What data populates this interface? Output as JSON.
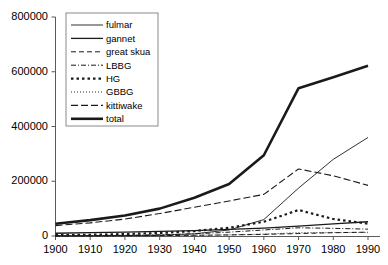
{
  "chart_data": {
    "type": "line",
    "title": "",
    "xlabel": "",
    "ylabel": "",
    "xlim": [
      1900,
      1990
    ],
    "ylim": [
      0,
      800000
    ],
    "grid": false,
    "legend_position": "top-left",
    "x": [
      1900,
      1910,
      1920,
      1930,
      1940,
      1950,
      1960,
      1970,
      1980,
      1990
    ],
    "xticks": [
      "1900",
      "1910",
      "1920",
      "1930",
      "1940",
      "1950",
      "1960",
      "1970",
      "1980",
      "1990"
    ],
    "yticks": [
      "0",
      "200000",
      "400000",
      "600000",
      "800000"
    ],
    "ytick_values": [
      0,
      200000,
      400000,
      600000,
      800000
    ],
    "series": [
      {
        "name": "fulmar",
        "style": "thin-solid",
        "values": [
          500,
          800,
          1500,
          3000,
          8000,
          22000,
          60000,
          175000,
          280000,
          360000
        ]
      },
      {
        "name": "gannet",
        "style": "solid",
        "values": [
          10000,
          12000,
          14000,
          17000,
          20000,
          24000,
          29000,
          36000,
          44000,
          52000
        ]
      },
      {
        "name": "great skua",
        "style": "dashed",
        "values": [
          300,
          500,
          900,
          1600,
          2600,
          4000,
          6000,
          9000,
          12000,
          14000
        ]
      },
      {
        "name": "LBBG",
        "style": "dash-dot",
        "values": [
          1000,
          1500,
          2500,
          4500,
          8000,
          14000,
          22000,
          30000,
          28000,
          25000
        ]
      },
      {
        "name": "HG",
        "style": "thick-dotted",
        "values": [
          3000,
          4500,
          7000,
          11000,
          18000,
          30000,
          52000,
          95000,
          62000,
          45000
        ]
      },
      {
        "name": "GBBG",
        "style": "fine-dotted",
        "values": [
          500,
          700,
          1000,
          1500,
          2500,
          4000,
          7000,
          12000,
          13000,
          13000
        ]
      },
      {
        "name": "kittiwake",
        "style": "long-dashed",
        "values": [
          38000,
          48000,
          62000,
          82000,
          105000,
          128000,
          152000,
          245000,
          220000,
          185000
        ]
      },
      {
        "name": "total",
        "style": "thick-solid",
        "values": [
          45000,
          58000,
          75000,
          100000,
          140000,
          190000,
          295000,
          540000,
          580000,
          622000
        ]
      }
    ]
  },
  "legend": {
    "items": [
      {
        "label": "fulmar"
      },
      {
        "label": "gannet"
      },
      {
        "label": "great skua"
      },
      {
        "label": "LBBG"
      },
      {
        "label": "HG"
      },
      {
        "label": "GBBG"
      },
      {
        "label": "kittiwake"
      },
      {
        "label": "total"
      }
    ]
  },
  "colors": {
    "axis": "#5a5a5a",
    "line": "#1a1a1a",
    "background": "#ffffff",
    "legend_border": "#8a8a8a"
  }
}
